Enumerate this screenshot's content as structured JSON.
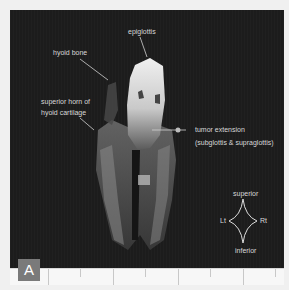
{
  "figure": {
    "panel_label": "A",
    "colors": {
      "background": "#1c1c1c",
      "annotation_text": "#d8d8d8",
      "label_box": "#7a7a7a",
      "ruler": "#f7f7f7"
    },
    "annotations": [
      {
        "id": "epiglottis",
        "text": "epiglottis"
      },
      {
        "id": "hyoid-bone",
        "text": "hyoid bone"
      },
      {
        "id": "superior-horn-line1",
        "text": "superior horn of"
      },
      {
        "id": "superior-horn-line2",
        "text": "hyoid cartilage"
      },
      {
        "id": "tumor-line1",
        "text": "tumor extension"
      },
      {
        "id": "tumor-line2",
        "text": "(subglottis & supraglottis)"
      }
    ],
    "orientation": {
      "superior": "superior",
      "inferior": "inferior",
      "left": "Lt",
      "right": "Rt"
    }
  }
}
